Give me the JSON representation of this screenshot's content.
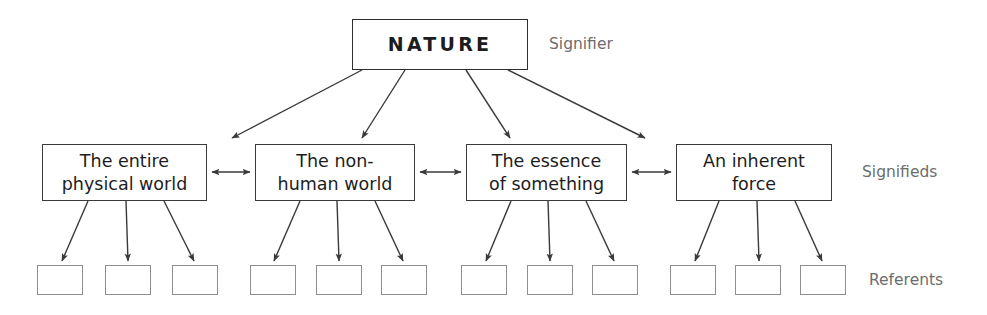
{
  "diagram": {
    "title_node": {
      "label": "NATURE",
      "role_label": "Signifier"
    },
    "row_labels": {
      "signifier": "Signifier",
      "signifieds": "Signifieds",
      "referents": "Referents"
    },
    "signifieds": [
      {
        "label": "The entire\nphysical world"
      },
      {
        "label": "The non-\nhuman world"
      },
      {
        "label": "The essence\nof something"
      },
      {
        "label": "An inherent\nforce"
      }
    ],
    "referents": [
      {
        "label": ""
      },
      {
        "label": ""
      },
      {
        "label": ""
      },
      {
        "label": ""
      },
      {
        "label": ""
      },
      {
        "label": ""
      },
      {
        "label": ""
      },
      {
        "label": ""
      },
      {
        "label": ""
      },
      {
        "label": ""
      },
      {
        "label": ""
      },
      {
        "label": ""
      }
    ],
    "colors": {
      "stroke": "#3a3a3a",
      "light_stroke": "#8e8e8e",
      "text": "#1d1d1d",
      "label_text": "#6d6d6d",
      "background": "#ffffff"
    }
  }
}
